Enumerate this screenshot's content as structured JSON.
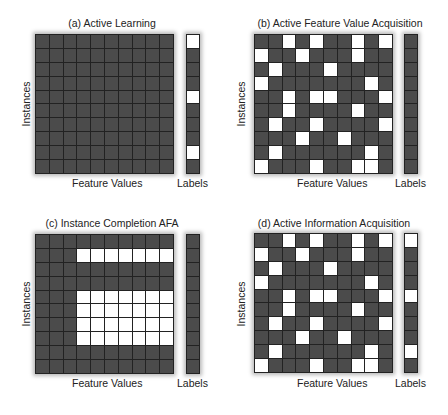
{
  "figure": {
    "x_label": "Feature Values",
    "y_label": "Instances",
    "labels_caption": "Labels",
    "colors": {
      "unknown": "#4b4b4b",
      "known": "#ffffff",
      "grid_line": "#222222"
    },
    "panels": [
      {
        "id": "a",
        "title": "(a) Active Learning",
        "grid_rows": 10,
        "grid_cols": 10,
        "white_cells": [],
        "white_labels": [
          0,
          4,
          8
        ]
      },
      {
        "id": "b",
        "title": "(b) Active Feature Value Acquisition",
        "grid_rows": 10,
        "grid_cols": 10,
        "white_cells": [
          [
            0,
            2
          ],
          [
            0,
            4
          ],
          [
            0,
            7
          ],
          [
            0,
            9
          ],
          [
            1,
            0
          ],
          [
            1,
            3
          ],
          [
            1,
            7
          ],
          [
            2,
            1
          ],
          [
            2,
            5
          ],
          [
            3,
            0
          ],
          [
            3,
            8
          ],
          [
            4,
            2
          ],
          [
            4,
            4
          ],
          [
            4,
            5
          ],
          [
            4,
            9
          ],
          [
            5,
            2
          ],
          [
            5,
            7
          ],
          [
            6,
            1
          ],
          [
            6,
            4
          ],
          [
            6,
            9
          ],
          [
            7,
            3
          ],
          [
            7,
            6
          ],
          [
            8,
            1
          ],
          [
            8,
            8
          ],
          [
            9,
            0
          ],
          [
            9,
            4
          ],
          [
            9,
            7
          ],
          [
            9,
            8
          ]
        ],
        "white_labels": []
      },
      {
        "id": "c",
        "title": "(c) Instance Completion AFA",
        "grid_rows": 10,
        "grid_cols": 10,
        "white_cells": [
          [
            1,
            3
          ],
          [
            1,
            4
          ],
          [
            1,
            5
          ],
          [
            1,
            6
          ],
          [
            1,
            7
          ],
          [
            1,
            8
          ],
          [
            1,
            9
          ],
          [
            4,
            3
          ],
          [
            4,
            4
          ],
          [
            4,
            5
          ],
          [
            4,
            6
          ],
          [
            4,
            7
          ],
          [
            4,
            8
          ],
          [
            4,
            9
          ],
          [
            5,
            3
          ],
          [
            5,
            4
          ],
          [
            5,
            5
          ],
          [
            5,
            6
          ],
          [
            5,
            7
          ],
          [
            5,
            8
          ],
          [
            5,
            9
          ],
          [
            6,
            3
          ],
          [
            6,
            4
          ],
          [
            6,
            5
          ],
          [
            6,
            6
          ],
          [
            6,
            7
          ],
          [
            6,
            8
          ],
          [
            6,
            9
          ],
          [
            7,
            3
          ],
          [
            7,
            4
          ],
          [
            7,
            5
          ],
          [
            7,
            6
          ],
          [
            7,
            7
          ],
          [
            7,
            8
          ],
          [
            7,
            9
          ]
        ],
        "white_labels": []
      },
      {
        "id": "d",
        "title": "(d) Active Information Acquisition",
        "grid_rows": 10,
        "grid_cols": 10,
        "white_cells": [
          [
            0,
            2
          ],
          [
            0,
            4
          ],
          [
            0,
            7
          ],
          [
            0,
            9
          ],
          [
            1,
            0
          ],
          [
            1,
            3
          ],
          [
            1,
            7
          ],
          [
            2,
            1
          ],
          [
            2,
            5
          ],
          [
            3,
            0
          ],
          [
            3,
            8
          ],
          [
            4,
            2
          ],
          [
            4,
            4
          ],
          [
            4,
            5
          ],
          [
            4,
            9
          ],
          [
            5,
            2
          ],
          [
            5,
            7
          ],
          [
            6,
            1
          ],
          [
            6,
            4
          ],
          [
            6,
            9
          ],
          [
            7,
            3
          ],
          [
            7,
            6
          ],
          [
            8,
            1
          ],
          [
            8,
            8
          ],
          [
            9,
            0
          ],
          [
            9,
            4
          ],
          [
            9,
            7
          ],
          [
            9,
            8
          ]
        ],
        "white_labels": [
          0,
          4,
          8
        ]
      }
    ]
  }
}
